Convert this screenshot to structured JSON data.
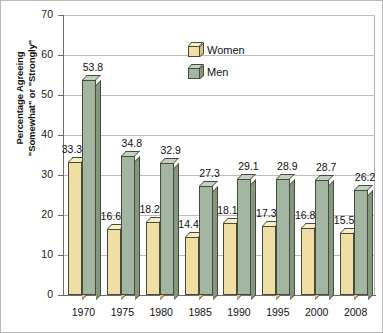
{
  "chart_data": {
    "type": "bar",
    "title": "",
    "xlabel": "",
    "ylabel_line1": "Percentage Agreeing",
    "ylabel_line2": "\"Somewhat\" or \"Strongly\"",
    "categories": [
      "1970",
      "1975",
      "1980",
      "1985",
      "1990",
      "1995",
      "2000",
      "2008"
    ],
    "series": [
      {
        "name": "Women",
        "color": "#efdfa4",
        "values": [
          33.3,
          16.6,
          18.2,
          14.4,
          18.1,
          17.3,
          16.8,
          15.5
        ],
        "labels": [
          "33.3",
          "16.6",
          "18.2",
          "14.4",
          "18.1",
          "17.3",
          "16.8",
          "15.5"
        ]
      },
      {
        "name": "Men",
        "color": "#a2b6a2",
        "values": [
          53.8,
          34.8,
          32.9,
          27.3,
          29.1,
          28.9,
          28.7,
          26.2
        ],
        "labels": [
          "53.8",
          "34.8",
          "32.9",
          "27.3",
          "29.1",
          "28.9",
          "28.7",
          "26.2"
        ]
      }
    ],
    "ylim": [
      0,
      70
    ],
    "yticks": [
      0,
      10,
      20,
      30,
      40,
      50,
      60,
      70
    ],
    "ytick_labels": [
      "0",
      "10",
      "20",
      "30",
      "40",
      "50",
      "60",
      "70"
    ],
    "grid": true,
    "legend_position": "top-center",
    "legend": [
      {
        "label": "Women",
        "swatch": "women-cube-icon"
      },
      {
        "label": "Men",
        "swatch": "men-cube-icon"
      }
    ]
  }
}
